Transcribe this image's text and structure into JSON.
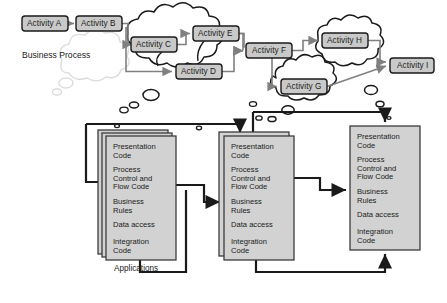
{
  "diagram": {
    "business_process_label": "Business Process",
    "applications_label": "Applications",
    "colors": {
      "activity_fill": "#c9c9c9",
      "activity_stroke": "#1a1a1a",
      "cloud_stroke": "#1a1a1a",
      "cloud_fill": "#ffffff",
      "ghost_cloud_stroke": "#d8d8d8",
      "app_fill": "#d2d2d2",
      "app_stroke": "#3c3c3c",
      "connector_dark": "#1a1a1a",
      "connector_gray": "#808080",
      "background": "#ffffff"
    },
    "activities": [
      {
        "id": "A",
        "label": "Activity A",
        "x": 22,
        "y": 16,
        "w": 46,
        "h": 15,
        "in_cloud": false
      },
      {
        "id": "B",
        "label": "Activity B",
        "x": 76,
        "y": 16,
        "w": 46,
        "h": 15,
        "in_cloud": false
      },
      {
        "id": "C",
        "label": "Activity C",
        "x": 131,
        "y": 37,
        "w": 46,
        "h": 15,
        "in_cloud": true
      },
      {
        "id": "D",
        "label": "Activity D",
        "x": 176,
        "y": 64,
        "w": 46,
        "h": 15,
        "in_cloud": true
      },
      {
        "id": "E",
        "label": "Activity E",
        "x": 193,
        "y": 26,
        "w": 46,
        "h": 15,
        "in_cloud": true
      },
      {
        "id": "F",
        "label": "Activity F",
        "x": 246,
        "y": 43,
        "w": 46,
        "h": 15,
        "in_cloud": false
      },
      {
        "id": "G",
        "label": "Activity G",
        "x": 281,
        "y": 79,
        "w": 46,
        "h": 15,
        "in_cloud": true
      },
      {
        "id": "H",
        "label": "Activity H",
        "x": 322,
        "y": 33,
        "w": 46,
        "h": 15,
        "in_cloud": true
      },
      {
        "id": "I",
        "label": "Activity I",
        "x": 390,
        "y": 58,
        "w": 44,
        "h": 15,
        "in_cloud": false
      }
    ],
    "activity_flow": [
      {
        "from": "A",
        "to": "B"
      },
      {
        "from": "B",
        "to": "C"
      },
      {
        "from": "B",
        "to": "D"
      },
      {
        "from": "C",
        "to": "E"
      },
      {
        "from": "D",
        "to": "F"
      },
      {
        "from": "E",
        "to": "F"
      },
      {
        "from": "F",
        "to": "H"
      },
      {
        "from": "F",
        "to": "G"
      },
      {
        "from": "H",
        "to": "I"
      },
      {
        "from": "G",
        "to": "I"
      }
    ],
    "clouds": [
      {
        "name": "cloud-activities-cde",
        "cx": 178,
        "cy": 52
      },
      {
        "name": "cloud-activity-h",
        "cx": 346,
        "cy": 47
      },
      {
        "name": "cloud-activity-g",
        "cx": 304,
        "cy": 82
      },
      {
        "name": "cloud-ghost-business-process",
        "cx": 90,
        "cy": 62
      }
    ],
    "applications": [
      {
        "name": "application-1",
        "stacked": true,
        "stack_count": 3,
        "x": 106,
        "y": 136,
        "w": 70,
        "h": 124,
        "layers": [
          "Presentation\nCode",
          "Process\nControl and\nFlow Code",
          "Business\nRules",
          "Data access",
          "Integration\nCode"
        ]
      },
      {
        "name": "application-2",
        "stacked": true,
        "stack_count": 2,
        "x": 224,
        "y": 136,
        "w": 70,
        "h": 124,
        "layers": [
          "Presentation\nCode",
          "Process\nControl and\nFlow Code",
          "Business\nRules",
          "Data access",
          "Integration\nCode"
        ]
      },
      {
        "name": "application-3",
        "stacked": false,
        "stack_count": 1,
        "x": 350,
        "y": 126,
        "w": 70,
        "h": 124,
        "layers": [
          "Presentation\nCode",
          "Process\nControl and\nFlow Code",
          "Business\nRules",
          "Data access",
          "Integration\nCode"
        ]
      }
    ],
    "app_layer_names": [
      "Presentation Code",
      "Process Control and Flow Code",
      "Business Rules",
      "Data access",
      "Integration Code"
    ],
    "app_connectors": [
      {
        "name": "process-to-app1",
        "desc": "from business process down-left into application 1"
      },
      {
        "name": "process-to-app2",
        "desc": "from business process down into application 2 top"
      },
      {
        "name": "process-to-app3",
        "desc": "from activity G cloud right then down into application 3 top"
      },
      {
        "name": "app1-to-app2",
        "desc": "from application 1 right into application 2 left"
      },
      {
        "name": "app2-to-app3",
        "desc": "from application 2 right into application 3 left"
      },
      {
        "name": "app1-bottom-to-app2",
        "desc": "from application 1 bottom right to application 2"
      },
      {
        "name": "app2-bottom-to-app3",
        "desc": "from application 2 bottom right then up into application 3 bottom"
      }
    ]
  }
}
